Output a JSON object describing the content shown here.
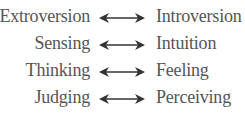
{
  "pairs": [
    {
      "left": "Extroversion",
      "right": "Introversion"
    },
    {
      "left": "Sensing",
      "right": "Intuition"
    },
    {
      "left": "Thinking",
      "right": "Feeling"
    },
    {
      "left": "Judging",
      "right": "Perceiving"
    }
  ],
  "arrow_icon": "double-headed-arrow",
  "colors": {
    "text": "#555555",
    "arrow": "#333333"
  }
}
